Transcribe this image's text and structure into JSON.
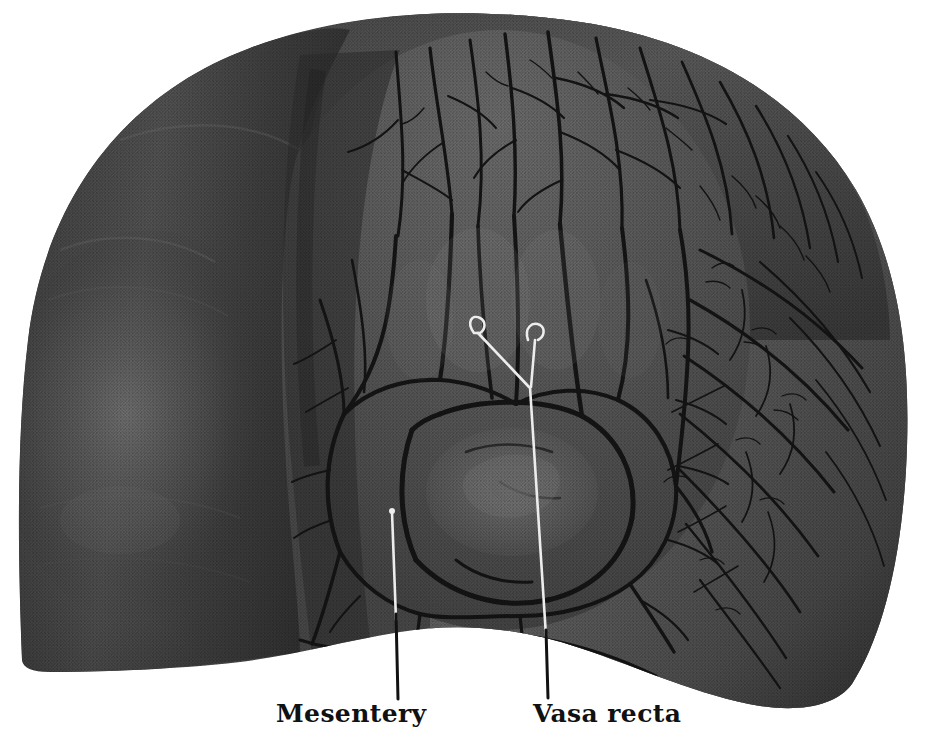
{
  "figure": {
    "kind": "anatomical-photograph-plate",
    "rendering": "halftone monochrome print",
    "background_color": "#ffffff"
  },
  "labels": [
    {
      "id": "mesentery",
      "text": "Mesentery",
      "leader": {
        "tip_x": 392,
        "tip_y": 510,
        "end_x": 398,
        "end_y": 699,
        "hook": "dot"
      }
    },
    {
      "id": "vasa-recta",
      "text": "Vasa recta",
      "leader": {
        "tip_x": 533,
        "tip_y": 333,
        "end_x": 548,
        "end_y": 698,
        "hook": "loop"
      }
    }
  ],
  "pointers": {
    "left_hook": {
      "x": 470,
      "y": 327
    },
    "right_hook": {
      "x": 533,
      "y": 331
    },
    "vertex": {
      "x": 529,
      "y": 387
    }
  },
  "palette": {
    "paper": "#ffffff",
    "bowel_dark": "#2b2b2b",
    "bowel_mid": "#3d3d3d",
    "mesentery_mid": "#5c5c5c",
    "mesentery_light": "#7c7c7c",
    "vessel_dark": "#1a1a1a",
    "highlight": "#9a9a9a",
    "leader_light": "#e8e8e8",
    "leader_dark": "#111111",
    "text": "#111111"
  },
  "regions": [
    {
      "name": "descending-limb",
      "description": "smooth dark bowel loop at left"
    },
    {
      "name": "transverse-arch",
      "description": "arched bowel top with radiating vessels"
    },
    {
      "name": "ascending-limb",
      "description": "densely vascular mesentery at right"
    },
    {
      "name": "mesenteric-arcades",
      "description": "polygonal vascular arcades at center"
    }
  ]
}
